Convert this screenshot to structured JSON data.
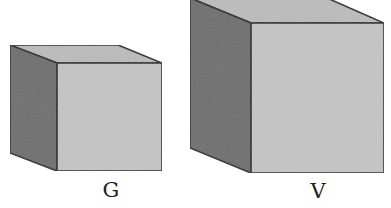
{
  "figure": {
    "cubes": [
      {
        "id": "small",
        "label": "G",
        "colors": {
          "front": "#c4c4c4",
          "top": "#bdbdbd",
          "side": "#6f6f6f",
          "edge": "#2a2a2a"
        }
      },
      {
        "id": "large",
        "label": "V",
        "colors": {
          "front": "#c4c4c4",
          "top": "#bdbdbd",
          "side": "#6f6f6f",
          "edge": "#2a2a2a"
        }
      }
    ]
  }
}
